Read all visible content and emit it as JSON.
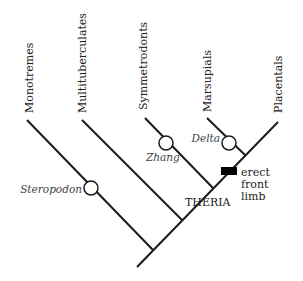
{
  "diagram": {
    "type": "cladogram",
    "taxa": [
      {
        "label": "Monotremes"
      },
      {
        "label": "Multituberculates"
      },
      {
        "label": "Symmetrodonts"
      },
      {
        "label": "Marsupials"
      },
      {
        "label": "Placentals"
      }
    ],
    "fossils": [
      {
        "label": "Steropodon"
      },
      {
        "label": "Zhang"
      },
      {
        "label": "Delta"
      }
    ],
    "clade_label": "THERIA",
    "trait": {
      "lines": [
        "erect",
        "front",
        "limb"
      ],
      "marker_color": "#000000"
    },
    "colors": {
      "line": "#1a1a1a",
      "background": "#ffffff"
    }
  }
}
